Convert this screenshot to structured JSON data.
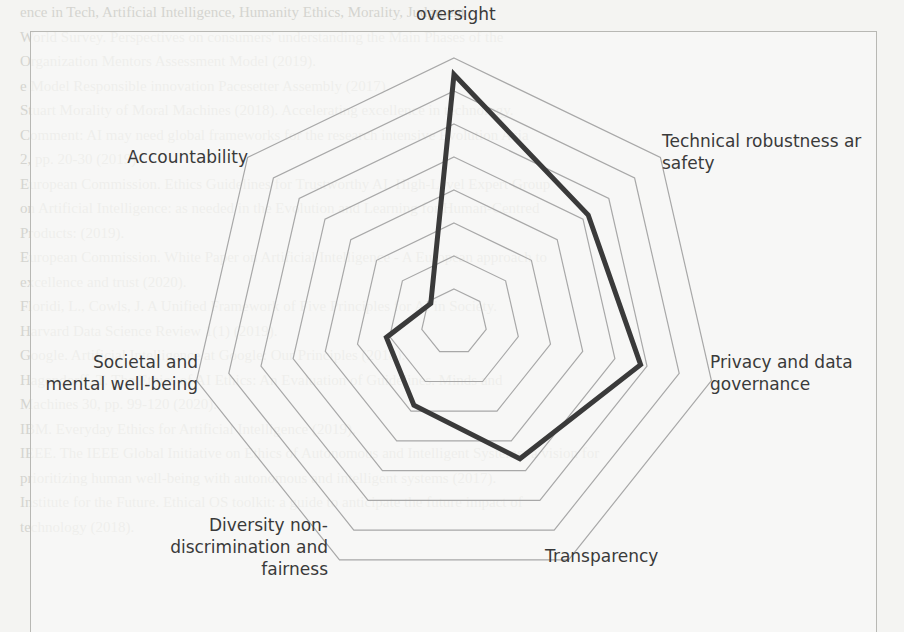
{
  "background_text": {
    "lines": [
      "ence in Tech, Artificial Intelligence, Humanity Ethics, Morality, Judgment",
      "World Survey. Perspectives on consumers' understanding the Main Phases of the",
      "Organization Mentors Assessment Model (2019).",
      "e Model Responsible innovation Pacesetter Assembly (2017).",
      "Stuart Morality of Moral Machines (2018). Accelerating excellence in technology.",
      "Comment: AI may need global frameworks for the research intensive Evolution Asia",
      "2, pp. 20-30 (2019).",
      "European Commission. Ethics Guidelines for Trustworthy AI. High-Level Expert Group",
      "on Artificial Intelligence: as needed in the Evolution and Learning for Human-Centred",
      "Products: (2019).",
      "European Commission. White Paper on Artificial Intelligence - A European approach to",
      "excellence and trust (2020).",
      "Floridi, L., Cowls, J. A Unified Framework of Five Principles for AI in Society.",
      "Harvard Data Science Review 1(1) (2019).",
      "Google. Artificial Intelligence at Google: Our Principles (2018).",
      "Hagendorff, T. The Ethics of AI Ethics: An Evaluation of Guidelines. Minds and",
      "Machines 30, pp. 99-120 (2020).",
      "IBM. Everyday Ethics for Artificial Intelligence (2019).",
      "IEEE. The IEEE Global Initiative on Ethics of Autonomous and Intelligent Systems: a vision for",
      "prioritizing human well-being with autonomous and intelligent systems (2017).",
      "Institute for the Future. Ethical OS toolkit: a guide to anticipate the future impact of",
      "technology (2018)."
    ]
  },
  "chart_data": {
    "type": "radar",
    "title": "",
    "axes": [
      "Human agency and oversight",
      "Technical robustness and safety",
      "Privacy and data governance",
      "Transparency",
      "Diversity non-discrimination and fairness",
      "Societal and mental well-being",
      "Accountability"
    ],
    "visible_labels": [
      "oversight",
      "Technical robustness and safety",
      "Privacy and data governance",
      "Transparency",
      "Diversity non-discrimination and fairness",
      "Societal and mental well-being",
      "Accountability"
    ],
    "series": [
      {
        "name": "Score",
        "values": [
          7.5,
          5.2,
          5.8,
          4.6,
          2.8,
          2.1,
          0.9
        ],
        "color": "#3a3a3a"
      }
    ],
    "rlim": [
      0,
      8
    ],
    "ring_count": 8,
    "grid": true,
    "grid_color": "#a8a8a8",
    "legend": "none"
  },
  "labels": {
    "oversight": "oversight",
    "technical_line1": "Technical robustness ar",
    "technical_line2": "safety",
    "privacy_line1": "Privacy and data",
    "privacy_line2": "governance",
    "transparency": "Transparency",
    "diversity_line1": "Diversity non-",
    "diversity_line2": "discrimination and",
    "diversity_line3": "fairness",
    "societal_line1": "Societal and",
    "societal_line2": "mental well-being",
    "accountability": "Accountability"
  }
}
